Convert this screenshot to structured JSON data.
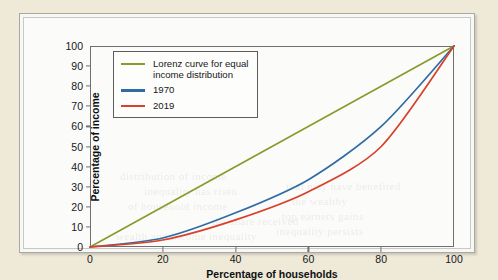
{
  "figure": {
    "background_color": "#efe9d8",
    "panel_color": "#fbfbfa"
  },
  "axes": {
    "x_title": "Percentage of households",
    "y_title": "Percentage of income",
    "x_ticks": [
      "0",
      "20",
      "40",
      "60",
      "80",
      "100"
    ],
    "y_ticks": [
      "0",
      "10",
      "20",
      "30",
      "40",
      "50",
      "60",
      "70",
      "80",
      "90",
      "100"
    ]
  },
  "legend": {
    "items": [
      {
        "label": "Lorenz curve for equal\nincome distribution",
        "color": "#8a9a2b"
      },
      {
        "label": "1970",
        "color": "#2f6ca5"
      },
      {
        "label": "2019",
        "color": "#d8412a"
      }
    ]
  },
  "ghost_text": [
    {
      "text": "distribution of income",
      "x": 96,
      "y": 152
    },
    {
      "text": "inequality has risen",
      "x": 120,
      "y": 167
    },
    {
      "text": "of household income",
      "x": 104,
      "y": 182
    },
    {
      "text": "the share received",
      "x": 188,
      "y": 197
    },
    {
      "text": "wealth and income inequality",
      "x": 92,
      "y": 212
    },
    {
      "text": "that may have benefited",
      "x": 262,
      "y": 162
    },
    {
      "text": "the wealthy",
      "x": 268,
      "y": 177
    },
    {
      "text": "top earners gains",
      "x": 258,
      "y": 192
    },
    {
      "text": "inequality persists",
      "x": 252,
      "y": 207
    }
  ],
  "chart_data": {
    "type": "line",
    "title": "",
    "xlabel": "Percentage of households",
    "ylabel": "Percentage of income",
    "xlim": [
      0,
      100
    ],
    "ylim": [
      0,
      100
    ],
    "grid": false,
    "legend_position": "upper-left",
    "series": [
      {
        "name": "Lorenz curve for equal income distribution",
        "color": "#8a9a2b",
        "x": [
          0,
          100
        ],
        "y": [
          0,
          100
        ]
      },
      {
        "name": "1970",
        "color": "#2f6ca5",
        "x": [
          0,
          20,
          40,
          60,
          80,
          100
        ],
        "y": [
          0,
          4.5,
          17,
          33.5,
          60,
          100
        ]
      },
      {
        "name": "2019",
        "color": "#d8412a",
        "x": [
          0,
          20,
          40,
          60,
          80,
          100
        ],
        "y": [
          0,
          3.5,
          13.5,
          27.5,
          50,
          100
        ]
      }
    ]
  }
}
